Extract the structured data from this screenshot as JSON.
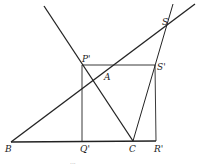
{
  "diagram": {
    "points": [
      {
        "id": "B",
        "label": "B",
        "x": 11,
        "y": 142,
        "lx": 5,
        "ly": 152
      },
      {
        "id": "Q",
        "label": "Q'",
        "x": 82,
        "y": 142,
        "lx": 80,
        "ly": 152
      },
      {
        "id": "C",
        "label": "C",
        "x": 133,
        "y": 141,
        "lx": 129,
        "ly": 152
      },
      {
        "id": "R",
        "label": "R'",
        "x": 156,
        "y": 141,
        "lx": 154,
        "ly": 152
      },
      {
        "id": "P",
        "label": "P'",
        "x": 82,
        "y": 65,
        "lx": 82,
        "ly": 62
      },
      {
        "id": "S1",
        "label": "S'",
        "x": 155,
        "y": 65,
        "lx": 157,
        "ly": 70
      },
      {
        "id": "A",
        "label": "A",
        "x": 105,
        "y": 78,
        "lx": 104,
        "ly": 80
      },
      {
        "id": "S",
        "label": "S",
        "x": 166,
        "y": 28,
        "lx": 162,
        "ly": 25
      }
    ],
    "lines": [
      {
        "name": "line-BS",
        "x1": 11,
        "y1": 142,
        "x2": 195,
        "y2": 4,
        "w": 1.3
      },
      {
        "name": "line-PC",
        "x1": 44,
        "y1": 6,
        "x2": 133,
        "y2": 141,
        "w": 1.3
      },
      {
        "name": "line-CS",
        "x1": 133,
        "y1": 141,
        "x2": 173,
        "y2": 4,
        "w": 1
      },
      {
        "name": "line-BR",
        "x1": 11,
        "y1": 142,
        "x2": 156,
        "y2": 141,
        "w": 1.3
      },
      {
        "name": "line-PQ",
        "x1": 82,
        "y1": 65,
        "x2": 82,
        "y2": 142,
        "w": 0.9
      },
      {
        "name": "line-PS1",
        "x1": 82,
        "y1": 65,
        "x2": 155,
        "y2": 65,
        "w": 0.9
      },
      {
        "name": "line-S1R",
        "x1": 155,
        "y1": 65,
        "x2": 156,
        "y2": 141,
        "w": 0.9
      }
    ],
    "footer_text": "..."
  }
}
